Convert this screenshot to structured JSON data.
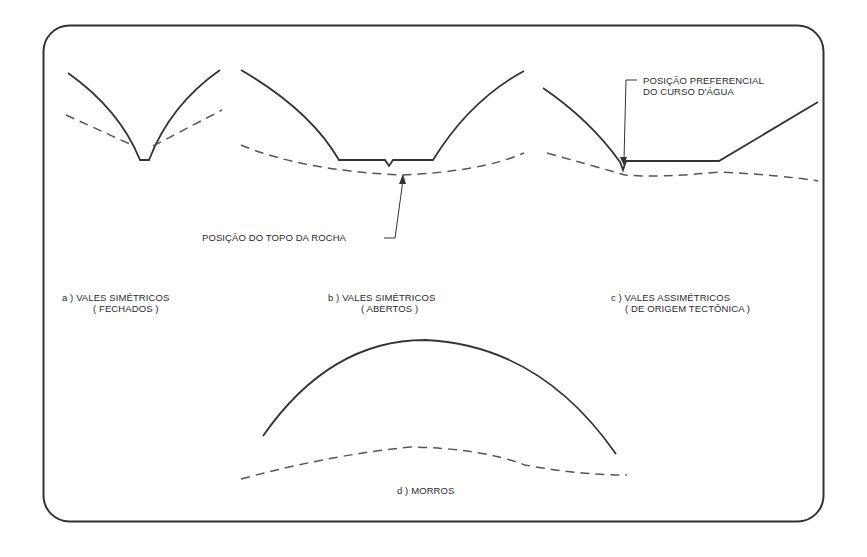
{
  "colors": {
    "frame": "#333333",
    "surface_line": "#333333",
    "rock_line": "#555555",
    "text": "#2a2a2a",
    "background": "#ffffff"
  },
  "legend": {
    "solid_line": "ground surface profile",
    "dashed_line": "top of rock profile"
  },
  "annotations": {
    "rock_top": "POSIÇÃO DO TOPO DA ROCHA",
    "stream_line1": "POSIÇÃO PREFERENCIAL",
    "stream_line2": "DO CURSO D'ÁGUA"
  },
  "panels": [
    {
      "id": "a",
      "title": "a )  VALES SIMÉTRICOS",
      "subtitle": "( FECHADOS )"
    },
    {
      "id": "b",
      "title": "b )  VALES SIMÉTRICOS",
      "subtitle": "( ABERTOS )"
    },
    {
      "id": "c",
      "title": "c )  VALES ASSIMÉTRICOS",
      "subtitle": "( DE ORIGEM TECTÔNICA )"
    },
    {
      "id": "d",
      "title": "d )  MORROS",
      "subtitle": ""
    }
  ]
}
